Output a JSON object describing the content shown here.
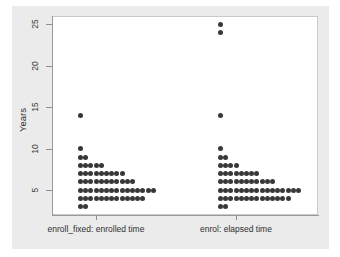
{
  "chart_data": {
    "type": "scatter",
    "subtype": "dot-density-plot",
    "title": "",
    "xlabel": "",
    "ylabel": "Years",
    "ylim": [
      2,
      26
    ],
    "yticks": [
      5,
      10,
      15,
      20,
      25
    ],
    "ytick_labels": [
      "5",
      "10",
      "15",
      "20",
      "25"
    ],
    "grid": false,
    "legend": "none",
    "categories": [
      "enroll_fixed: enrolled time",
      "enrol: elapsed time"
    ],
    "series": [
      {
        "name": "enroll_fixed: enrolled time",
        "description": "Dot-density stack: each dot is one observation, stacked rightward at its Years value",
        "stacks": [
          {
            "years": 14,
            "count": 1
          },
          {
            "years": 10,
            "count": 1
          },
          {
            "years": 9,
            "count": 2
          },
          {
            "years": 8,
            "count": 5
          },
          {
            "years": 7,
            "count": 9
          },
          {
            "years": 6,
            "count": 11
          },
          {
            "years": 5,
            "count": 15
          },
          {
            "years": 4,
            "count": 13
          },
          {
            "years": 3,
            "count": 2
          }
        ]
      },
      {
        "name": "enrol: elapsed time",
        "description": "Dot-density stack: each dot is one observation, stacked rightward at its Years value",
        "stacks": [
          {
            "years": 25,
            "count": 1
          },
          {
            "years": 24,
            "count": 1
          },
          {
            "years": 14,
            "count": 1
          },
          {
            "years": 10,
            "count": 1
          },
          {
            "years": 9,
            "count": 2
          },
          {
            "years": 8,
            "count": 4
          },
          {
            "years": 7,
            "count": 8
          },
          {
            "years": 6,
            "count": 11
          },
          {
            "years": 5,
            "count": 16
          },
          {
            "years": 4,
            "count": 14
          },
          {
            "years": 3,
            "count": 2
          }
        ]
      }
    ],
    "colors": {
      "dot": "#383838",
      "axis": "#8d8d8d",
      "plot_background": "#ffffff",
      "graph_background": "#ebebeb",
      "text": "#2e2e2e"
    }
  },
  "axis": {
    "y_title": "Years",
    "y_tick_labels": [
      "5",
      "10",
      "15",
      "20",
      "25"
    ],
    "x_group_labels": [
      "enroll_fixed: enrolled time",
      "enrol: elapsed time"
    ]
  }
}
